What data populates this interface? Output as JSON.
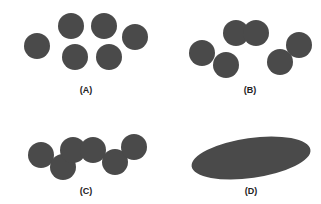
{
  "figure": {
    "fill_color": "#4a4a4a",
    "panels": [
      {
        "id": "A",
        "label": "(A)",
        "label_pos": [
          86,
          93
        ],
        "description": "six separate circles",
        "circles": [
          [
            37,
            46
          ],
          [
            71,
            26
          ],
          [
            104,
            26
          ],
          [
            135,
            37
          ],
          [
            75,
            57
          ],
          [
            109,
            57
          ]
        ],
        "radius": 13
      },
      {
        "id": "B",
        "label": "(B)",
        "label_pos": [
          250,
          93
        ],
        "description": "three pairs of fused circles",
        "circles": [
          [
            202,
            53
          ],
          [
            226,
            65
          ],
          [
            236,
            33
          ],
          [
            256,
            33
          ],
          [
            280,
            62
          ],
          [
            299,
            45
          ]
        ],
        "radius": 13
      },
      {
        "id": "C",
        "label": "(C)",
        "label_pos": [
          86,
          194
        ],
        "description": "chain of fused circles",
        "circles": [
          [
            41,
            155
          ],
          [
            63,
            167
          ],
          [
            73,
            150
          ],
          [
            93,
            150
          ],
          [
            115,
            162
          ],
          [
            134,
            147
          ]
        ],
        "radius": 13
      },
      {
        "id": "D",
        "label": "(D)",
        "label_pos": [
          251,
          194
        ],
        "description": "single ellipse",
        "ellipse": {
          "cx": 251,
          "cy": 158,
          "rx": 60,
          "ry": 20,
          "rotate": -8
        }
      }
    ]
  }
}
